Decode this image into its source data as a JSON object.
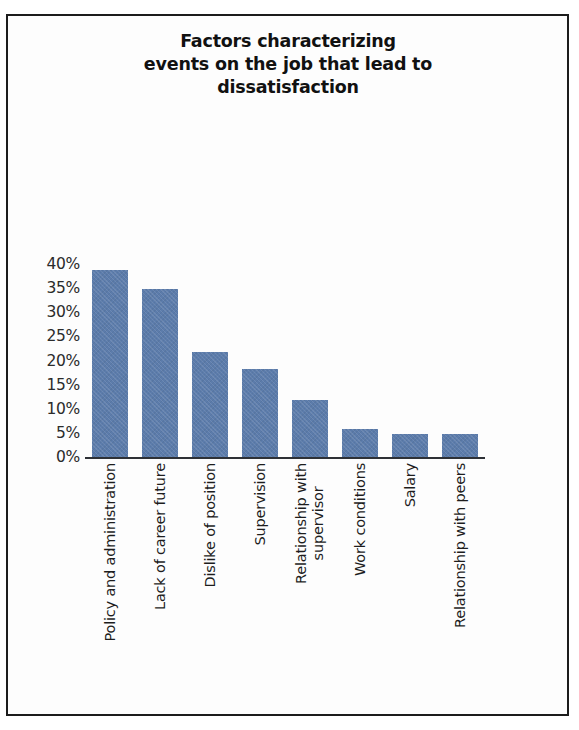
{
  "chart_data": {
    "type": "bar",
    "title": "Factors characterizing events on the job that lead to dissatisfaction",
    "title_lines": [
      "Factors characterizing",
      "events on the job that lead to",
      "dissatisfaction"
    ],
    "xlabel": "",
    "ylabel": "",
    "ylim": [
      0,
      40
    ],
    "ytick_labels": [
      "40%",
      "35%",
      "30%",
      "25%",
      "20%",
      "15%",
      "10%",
      "5%",
      "0%"
    ],
    "ytick_values": [
      40,
      35,
      30,
      25,
      20,
      15,
      10,
      5,
      0
    ],
    "grid": false,
    "legend": false,
    "bar_color": "#5c7cab",
    "axis_color": "#2e3136",
    "categories": [
      "Policy and administration",
      "Lack of career future",
      "Dislike of position",
      "Supervision",
      "Relationship with supervisor",
      "Work conditions",
      "Salary",
      "Relationship with peers"
    ],
    "category_lines": [
      [
        "Policy and administration"
      ],
      [
        "Lack of career future"
      ],
      [
        "Dislike of position"
      ],
      [
        "Supervision"
      ],
      [
        "Relationship with",
        "supervisor"
      ],
      [
        "Work conditions"
      ],
      [
        "Salary"
      ],
      [
        "Relationship with peers"
      ]
    ],
    "values": [
      39,
      35,
      22,
      18.5,
      12,
      6,
      5,
      5
    ],
    "value_unit": "%"
  }
}
